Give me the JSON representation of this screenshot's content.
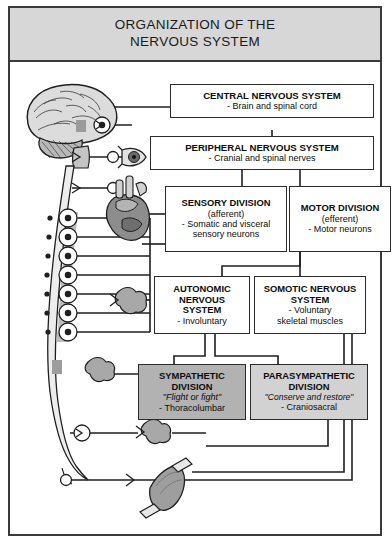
{
  "title": {
    "line1": "ORGANIZATION OF THE",
    "line2": "NERVOUS SYSTEM"
  },
  "boxes": {
    "cns": {
      "heading": "CENTRAL NERVOUS SYSTEM",
      "detail": "- Brain and spinal cord"
    },
    "pns": {
      "heading": "PERIPHERAL NERVOUS SYSTEM",
      "detail": "- Cranial and spinal nerves"
    },
    "sensory": {
      "heading": "SENSORY DIVISION",
      "sub": "(afferent)",
      "detail1": "- Somatic and visceral",
      "detail2": "sensory neurons"
    },
    "motor": {
      "heading": "MOTOR DIVISION",
      "sub": "(efferent)",
      "detail": "- Motor neurons"
    },
    "autonomic": {
      "heading1": "AUTONOMIC",
      "heading2": "NERVOUS",
      "heading3": "SYSTEM",
      "detail": "- Involuntary"
    },
    "somatic": {
      "heading1": "SOMOTIC NERVOUS",
      "heading2": "SYSTEM",
      "detail1": "- Voluntary",
      "detail2": "skeletal muscles"
    },
    "sympathetic": {
      "heading1": "SYMPATHETIC",
      "heading2": "DIVISION",
      "quote": "\"Flight or fight\"",
      "detail": "- Thoracolumbar"
    },
    "parasympathetic": {
      "heading1": "PARASYMPATHETIC",
      "heading2": "DIVISION",
      "quote": "\"Conserve and restore\"",
      "detail": "- Craniosacral"
    }
  },
  "illustration": {
    "brain": "brain-illustration",
    "spinal_cord": "spinal-cord-illustration",
    "eye": "eye-illustration",
    "heart": "heart-illustration",
    "muscle": "skeletal-muscle-illustration",
    "ganglion_chain": "sympathetic-ganglion-chain",
    "glands": "gland-illustration"
  },
  "colors": {
    "title_band": "#d7d7d7",
    "frame_border": "#3a3a3a",
    "box_border": "#2b2b2b",
    "sympathetic_fill": "#b2b2b2",
    "parasympathetic_fill": "#d2d2d2",
    "connector": "#1f1f1f",
    "tissue_gray": "#9a9a9a",
    "tissue_light": "#dcdcdc"
  }
}
